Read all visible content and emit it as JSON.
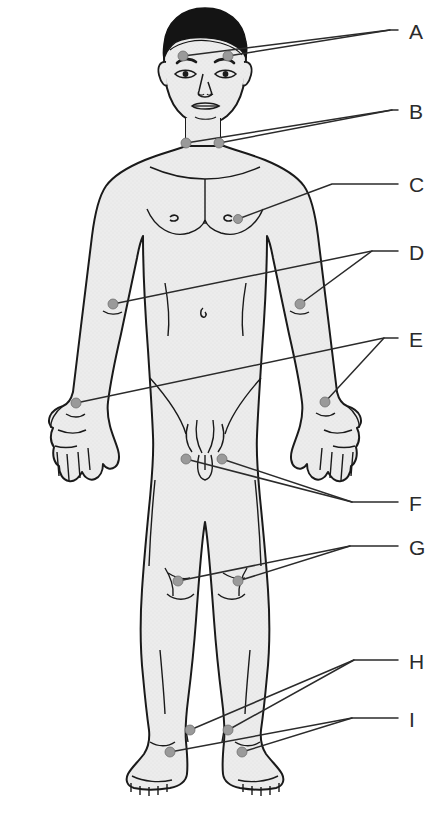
{
  "figure": {
    "view": "anterior full-body male figure",
    "body_fill": "#ececec",
    "outline_color": "#1a1a1a",
    "hair_color": "#141414",
    "marker_color": "#9a9a9a",
    "marker_stroke": "#6f6f6f",
    "leader_color": "#2b2b2b",
    "label_color": "#2b2b2b",
    "background": "#ffffff"
  },
  "labels": [
    {
      "id": "A",
      "text": "A",
      "x": 409,
      "y": 32
    },
    {
      "id": "B",
      "text": "B",
      "x": 409,
      "y": 112
    },
    {
      "id": "C",
      "text": "C",
      "x": 409,
      "y": 185
    },
    {
      "id": "D",
      "text": "D",
      "x": 409,
      "y": 253
    },
    {
      "id": "E",
      "text": "E",
      "x": 409,
      "y": 340
    },
    {
      "id": "F",
      "text": "F",
      "x": 409,
      "y": 504
    },
    {
      "id": "G",
      "text": "G",
      "x": 409,
      "y": 548
    },
    {
      "id": "H",
      "text": "H",
      "x": 409,
      "y": 662
    },
    {
      "id": "I",
      "text": "I",
      "x": 409,
      "y": 720
    }
  ],
  "markers": [
    {
      "name": "temporal-left",
      "x": 183,
      "y": 56,
      "r": 5.0,
      "label": "A"
    },
    {
      "name": "temporal-right",
      "x": 228,
      "y": 56,
      "r": 5.0,
      "label": "A"
    },
    {
      "name": "carotid-left",
      "x": 186,
      "y": 143,
      "r": 5.0,
      "label": "B"
    },
    {
      "name": "carotid-right",
      "x": 219,
      "y": 143,
      "r": 5.0,
      "label": "B"
    },
    {
      "name": "apical-chest",
      "x": 238,
      "y": 219,
      "r": 4.5,
      "label": "C"
    },
    {
      "name": "brachial-left",
      "x": 113,
      "y": 304,
      "r": 5.0,
      "label": "D"
    },
    {
      "name": "brachial-right",
      "x": 300,
      "y": 304,
      "r": 5.0,
      "label": "D"
    },
    {
      "name": "radial-left",
      "x": 76,
      "y": 403,
      "r": 5.0,
      "label": "E"
    },
    {
      "name": "radial-right",
      "x": 325,
      "y": 402,
      "r": 5.0,
      "label": "E"
    },
    {
      "name": "femoral-left",
      "x": 186,
      "y": 459,
      "r": 5.0,
      "label": "F"
    },
    {
      "name": "femoral-right",
      "x": 222,
      "y": 459,
      "r": 5.0,
      "label": "F"
    },
    {
      "name": "popliteal-left",
      "x": 178,
      "y": 581,
      "r": 5.0,
      "label": "G"
    },
    {
      "name": "popliteal-right",
      "x": 238,
      "y": 581,
      "r": 5.0,
      "label": "G"
    },
    {
      "name": "dorsalis-pedis-left",
      "x": 190,
      "y": 730,
      "r": 5.0,
      "label": "H"
    },
    {
      "name": "dorsalis-pedis-right",
      "x": 228,
      "y": 730,
      "r": 5.0,
      "label": "H"
    },
    {
      "name": "posterior-tibial-left",
      "x": 170,
      "y": 752,
      "r": 5.0,
      "label": "I"
    },
    {
      "name": "posterior-tibial-right",
      "x": 242,
      "y": 752,
      "r": 5.0,
      "label": "I"
    }
  ],
  "leaders": [
    {
      "name": "leader-A-1",
      "points": "183,56 390,30 398,30"
    },
    {
      "name": "leader-A-2",
      "points": "228,56 390,30"
    },
    {
      "name": "leader-B-1",
      "points": "186,143 392,110 398,110"
    },
    {
      "name": "leader-B-2",
      "points": "219,143 392,110"
    },
    {
      "name": "leader-C-1",
      "points": "238,219 332,184 398,184"
    },
    {
      "name": "leader-D-1",
      "points": "113,304 372,251 398,251"
    },
    {
      "name": "leader-D-2",
      "points": "300,304 372,251"
    },
    {
      "name": "leader-E-1",
      "points": "76,403 384,338 398,338"
    },
    {
      "name": "leader-E-2",
      "points": "325,402 384,338"
    },
    {
      "name": "leader-F-1",
      "points": "186,459 352,502 398,502"
    },
    {
      "name": "leader-F-2",
      "points": "222,459 352,502"
    },
    {
      "name": "leader-G-1",
      "points": "178,581 350,546 398,546"
    },
    {
      "name": "leader-G-2",
      "points": "238,581 350,546"
    },
    {
      "name": "leader-H-1",
      "points": "190,730 354,660 398,660"
    },
    {
      "name": "leader-H-2",
      "points": "228,730 354,660"
    },
    {
      "name": "leader-I-1",
      "points": "170,752 352,718 398,718"
    },
    {
      "name": "leader-I-2",
      "points": "242,752 352,718"
    }
  ]
}
